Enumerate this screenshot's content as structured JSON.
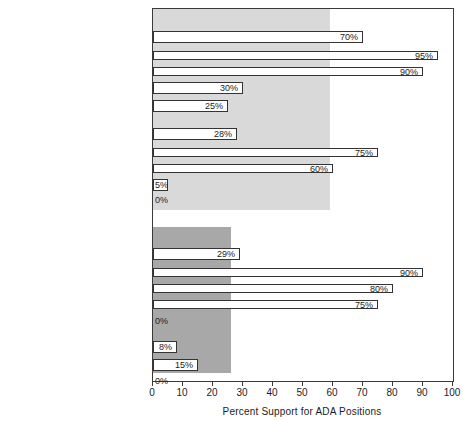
{
  "chart_data": {
    "type": "bar",
    "title": "",
    "xlabel": "Percent Support for ADA Positions",
    "ylabel": "",
    "xlim": [
      0,
      100
    ],
    "orientation": "horizontal",
    "grid": false,
    "legend": "none",
    "xticks": [
      0,
      10,
      20,
      30,
      40,
      50,
      60,
      70,
      80,
      90,
      100
    ],
    "xtick_labels": [
      "0",
      "10",
      "20",
      "30",
      "40",
      "50",
      "60",
      "70",
      "80",
      "90",
      "100"
    ],
    "groups": [
      {
        "name": "ALL DEMOCRATS",
        "header_label": "ALL DEMOCRATS (59%)",
        "reference_value": 59,
        "band_color": "#d9d9d9",
        "categories": [
          "NORTHERN",
          "Kennedy (Mass.)",
          "Clark (Iowa) et al.",
          "Cannon (Nev.)",
          "Zorinsky (Neb.)",
          "SOUTHERN",
          "Bumpers (Ark.)",
          "Sasser (Tenn.)",
          "Stennis (Miss.)",
          "Allen (Ala.)"
        ],
        "values": [
          70,
          95,
          90,
          30,
          25,
          28,
          75,
          60,
          5,
          0
        ],
        "value_labels": [
          "70%",
          "95%",
          "90%",
          "30%",
          "25%",
          "28%",
          "75%",
          "60%",
          "5%",
          "0%"
        ]
      },
      {
        "name": "ALL REPUBLICANS",
        "header_label": "ALL REPUBLICANS (26%)",
        "reference_value": 26,
        "band_color": "#a8a8a8",
        "categories": [
          "NORTHERN",
          "Case (N. J.)",
          "Brooke (Mass.), Javits (N.Y.)",
          "Mathias (Md.)",
          "Curtis (Neb.) et al.",
          "SOUTHERN",
          "Baker (Tenn.), Tower (Tex.)",
          "Helms (N.C.)"
        ],
        "values": [
          29,
          90,
          80,
          75,
          0,
          8,
          15,
          0
        ],
        "value_labels": [
          "29%",
          "90%",
          "80%",
          "75%",
          "0%",
          "8%",
          "15%",
          "0%"
        ]
      }
    ]
  },
  "rows": [
    {
      "id": "all-democrats",
      "label": "ALL DEMOCRATS (59%)",
      "label_kind": "header",
      "value": null,
      "value_label": "",
      "y": 8,
      "band": "dem"
    },
    {
      "id": "dem-northern",
      "label": "NORTHERN",
      "label_kind": "header",
      "value": 70,
      "value_label": "70%",
      "y": 27,
      "band": "dem",
      "bar": "thick"
    },
    {
      "id": "kennedy",
      "label": "Kennedy (Mass.)",
      "label_kind": "name",
      "value": 95,
      "value_label": "95%",
      "y": 46,
      "band": "dem",
      "bar": "thin"
    },
    {
      "id": "clark",
      "label": "Clark (Iowa) ",
      "label_italic": "et al.",
      "label_kind": "name",
      "value": 90,
      "value_label": "90%",
      "y": 62,
      "band": "dem",
      "bar": "thin"
    },
    {
      "id": "cannon",
      "label": "Cannon (Nev.)",
      "label_kind": "name",
      "value": 30,
      "value_label": "30%",
      "y": 78,
      "band": "dem",
      "bar": "thick"
    },
    {
      "id": "zorinsky",
      "label": "Zorinsky (Neb.)",
      "label_kind": "name",
      "value": 25,
      "value_label": "25%",
      "y": 96,
      "band": "dem",
      "bar": "thick"
    },
    {
      "id": "dem-southern",
      "label": "SOUTHERN",
      "label_kind": "header",
      "value": 28,
      "value_label": "28%",
      "y": 124,
      "band": "dem",
      "bar": "thick"
    },
    {
      "id": "bumpers",
      "label": "Bumpers (Ark.)",
      "label_kind": "name",
      "value": 75,
      "value_label": "75%",
      "y": 143,
      "band": "dem",
      "bar": "thin"
    },
    {
      "id": "sasser",
      "label": "Sasser (Tenn.)",
      "label_kind": "name",
      "value": 60,
      "value_label": "60%",
      "y": 159,
      "band": "dem",
      "bar": "thin"
    },
    {
      "id": "stennis",
      "label": "Stennis (Miss.)",
      "label_kind": "name",
      "value": 5,
      "value_label": "5%",
      "y": 175,
      "band": "dem",
      "bar": "thick"
    },
    {
      "id": "allen",
      "label": "Allen (Ala.)",
      "label_kind": "name",
      "value": 0,
      "value_label": "0%",
      "y": 190,
      "band": "dem",
      "bar": "none"
    },
    {
      "id": "all-republicans",
      "label": "ALL REPUBLICANS (26%)",
      "label_kind": "header",
      "value": null,
      "value_label": "",
      "y": 228,
      "band": "rep"
    },
    {
      "id": "rep-northern",
      "label": "NORTHERN",
      "label_kind": "header",
      "value": 29,
      "value_label": "29%",
      "y": 244,
      "band": "rep",
      "bar": "thick"
    },
    {
      "id": "case",
      "label": "Case (N. J.)",
      "label_kind": "name",
      "value": 90,
      "value_label": "90%",
      "y": 263,
      "band": "rep",
      "bar": "thin"
    },
    {
      "id": "brooke-javits",
      "label": "Brooke (Mass.), Javits (N.Y.)",
      "label_kind": "name",
      "value": 80,
      "value_label": "80%",
      "y": 279,
      "band": "rep",
      "bar": "thin"
    },
    {
      "id": "mathias",
      "label": "Mathias (Md.)",
      "label_kind": "name",
      "value": 75,
      "value_label": "75%",
      "y": 295,
      "band": "rep",
      "bar": "thin"
    },
    {
      "id": "curtis",
      "label": "Curtis (Neb.) ",
      "label_italic": "et al.",
      "label_kind": "name",
      "value": 0,
      "value_label": "0%",
      "y": 311,
      "band": "rep",
      "bar": "none"
    },
    {
      "id": "rep-southern",
      "label": "SOUTHERN",
      "label_kind": "header",
      "value": 8,
      "value_label": "8%",
      "y": 337,
      "band": "rep",
      "bar": "thick"
    },
    {
      "id": "baker-tower",
      "label": "Baker (Tenn.), Tower (Tex.)",
      "label_kind": "name",
      "value": 15,
      "value_label": "15%",
      "y": 355,
      "band": "rep",
      "bar": "thick"
    },
    {
      "id": "helms",
      "label": "Helms (N.C.)",
      "label_kind": "name",
      "value": 0,
      "value_label": "0%",
      "y": 371,
      "band": "rep",
      "bar": "none"
    }
  ],
  "bands": [
    {
      "id": "dem-band",
      "top": 8,
      "height": 201,
      "value": 59,
      "color": "#d9d9d9"
    },
    {
      "id": "rep-band",
      "top": 226,
      "height": 146,
      "value": 26,
      "color": "#a8a8a8"
    }
  ],
  "axis": {
    "title": "Percent Support for ADA Positions",
    "min": 0,
    "max": 100,
    "ticks": [
      "0",
      "10",
      "20",
      "30",
      "40",
      "50",
      "60",
      "70",
      "80",
      "90",
      "100"
    ]
  }
}
